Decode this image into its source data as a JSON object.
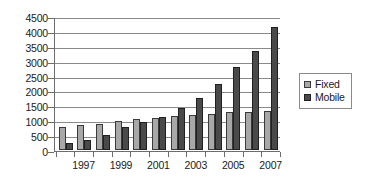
{
  "chart_data": {
    "type": "bar",
    "title": "",
    "subtitle": "",
    "xlabel": "",
    "ylabel": "",
    "ylim": [
      0,
      4500
    ],
    "ytick_step": 500,
    "yticks": [
      4500,
      4000,
      3500,
      3000,
      2500,
      2000,
      1500,
      1000,
      500,
      0
    ],
    "grid": true,
    "legend_position": "right",
    "categories": [
      "1996",
      "1997",
      "1998",
      "1999",
      "2000",
      "2001",
      "2002",
      "2003",
      "2004",
      "2005",
      "2006",
      "2007"
    ],
    "visible_tick_labels": [
      "1997",
      "1999",
      "2001",
      "2003",
      "2005",
      "2007"
    ],
    "series": [
      {
        "name": "Fixed",
        "color": "#a8a8a8",
        "values": [
          760,
          820,
          870,
          950,
          1010,
          1060,
          1120,
          1160,
          1190,
          1250,
          1250,
          1280
        ]
      },
      {
        "name": "Mobile",
        "color": "#4a4a4a",
        "values": [
          210,
          320,
          490,
          740,
          940,
          1090,
          1400,
          1720,
          2200,
          2780,
          3320,
          4100
        ]
      }
    ]
  },
  "legend": {
    "items": [
      {
        "label": "Fixed",
        "swatch": "fixed-swatch"
      },
      {
        "label": "Mobile",
        "swatch": "mobile-swatch"
      }
    ]
  }
}
